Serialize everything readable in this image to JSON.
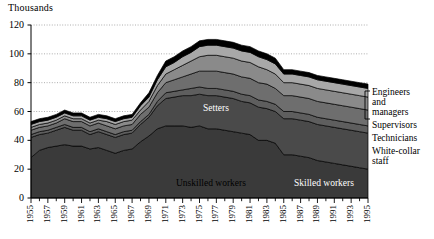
{
  "chart_data": {
    "type": "area",
    "stacked": true,
    "title": "",
    "ylabel": "Thousands",
    "xlabel": "",
    "ylim": [
      0,
      120
    ],
    "yticks": [
      0,
      20,
      40,
      60,
      80,
      100,
      120
    ],
    "grid": true,
    "grid_style": "dotted horizontal",
    "legend_position": "right-bracket",
    "x": [
      1955,
      1956,
      1957,
      1958,
      1959,
      1960,
      1961,
      1962,
      1963,
      1964,
      1965,
      1966,
      1967,
      1968,
      1969,
      1970,
      1971,
      1972,
      1973,
      1974,
      1975,
      1976,
      1977,
      1978,
      1979,
      1980,
      1981,
      1982,
      1983,
      1984,
      1985,
      1986,
      1987,
      1988,
      1989,
      1990,
      1991,
      1992,
      1993,
      1994,
      1995
    ],
    "xtick_labels": [
      "1955",
      "1957",
      "1959",
      "1961",
      "1963",
      "1965",
      "1967",
      "1969",
      "1971",
      "1973",
      "1975",
      "1977",
      "1979",
      "1981",
      "1983",
      "1985",
      "1987",
      "1989",
      "1991",
      "1993",
      "1995"
    ],
    "series": [
      {
        "name": "Unskilled workers",
        "color": "#3a3a3a",
        "values": [
          28,
          33,
          35,
          36,
          37,
          36,
          36,
          34,
          35,
          33,
          31,
          33,
          34,
          39,
          43,
          48,
          50,
          50,
          50,
          49,
          50,
          48,
          48,
          47,
          46,
          45,
          44,
          40,
          40,
          38,
          30,
          30,
          29,
          28,
          26,
          25,
          24,
          23,
          22,
          21,
          20
        ]
      },
      {
        "name": "Skilled workers",
        "color": "#4a4a4a",
        "values": [
          14,
          11,
          10,
          11,
          12,
          11,
          11,
          10,
          11,
          11,
          11,
          11,
          11,
          12,
          13,
          16,
          19,
          20,
          21,
          22,
          22,
          23,
          23,
          23,
          23,
          22,
          22,
          23,
          22,
          22,
          25,
          25,
          25,
          25,
          25,
          25,
          25,
          25,
          25,
          25,
          25
        ]
      },
      {
        "name": "Setters",
        "color": "#5e5e5e",
        "values": [
          2,
          2,
          2,
          2,
          2,
          2,
          2,
          2,
          2,
          2,
          2,
          2,
          2,
          2,
          2,
          3,
          4,
          4,
          4,
          5,
          5,
          5,
          5,
          5,
          5,
          5,
          5,
          5,
          5,
          5,
          5,
          5,
          5,
          5,
          5,
          5,
          5,
          5,
          5,
          5,
          5
        ]
      },
      {
        "name": "White-collar staff",
        "color": "#6e6e6e",
        "values": [
          3,
          3,
          3,
          3,
          4,
          4,
          4,
          4,
          4,
          4,
          4,
          4,
          4,
          5,
          5,
          6,
          7,
          8,
          9,
          10,
          11,
          12,
          12,
          12,
          12,
          12,
          12,
          12,
          12,
          11,
          11,
          11,
          11,
          11,
          11,
          11,
          11,
          11,
          11,
          11,
          11
        ]
      },
      {
        "name": "Technicians",
        "color": "#8a8a8a",
        "values": [
          2,
          2,
          2,
          2,
          2,
          2,
          2,
          2,
          2,
          3,
          3,
          3,
          3,
          3,
          4,
          5,
          6,
          7,
          8,
          9,
          10,
          11,
          11,
          11,
          11,
          11,
          11,
          11,
          10,
          10,
          9,
          9,
          9,
          9,
          9,
          9,
          9,
          9,
          9,
          9,
          9
        ]
      },
      {
        "name": "Supervisors",
        "color": "#a8a8a8",
        "values": [
          2,
          2,
          2,
          2,
          2,
          2,
          2,
          2,
          2,
          2,
          2,
          2,
          2,
          3,
          3,
          4,
          5,
          5,
          6,
          6,
          7,
          7,
          7,
          7,
          7,
          7,
          7,
          7,
          7,
          7,
          6,
          6,
          6,
          6,
          6,
          6,
          6,
          6,
          6,
          6,
          6
        ]
      },
      {
        "name": "Engineers and managers",
        "color": "#000000",
        "values": [
          2,
          2,
          2,
          2,
          2,
          2,
          2,
          2,
          2,
          2,
          2,
          2,
          2,
          2,
          3,
          3,
          4,
          4,
          4,
          4,
          4,
          4,
          4,
          4,
          4,
          4,
          4,
          4,
          4,
          4,
          3,
          3,
          3,
          3,
          3,
          3,
          3,
          3,
          3,
          3,
          3
        ]
      }
    ],
    "inline_labels": [
      {
        "text": "Setters",
        "series": "Setters"
      },
      {
        "text": "Unskilled workers",
        "series": "Unskilled workers"
      },
      {
        "text": "Skilled workers",
        "series": "Skilled workers"
      }
    ],
    "legend_entries": [
      {
        "text": "Engineers\nand\nmanagers",
        "color": "#000000"
      },
      {
        "text": "Supervisors",
        "color": "#a8a8a8"
      },
      {
        "text": "Technicians",
        "color": "#8a8a8a"
      },
      {
        "text": "White-collar\nstaff",
        "color": "#6e6e6e"
      }
    ]
  }
}
